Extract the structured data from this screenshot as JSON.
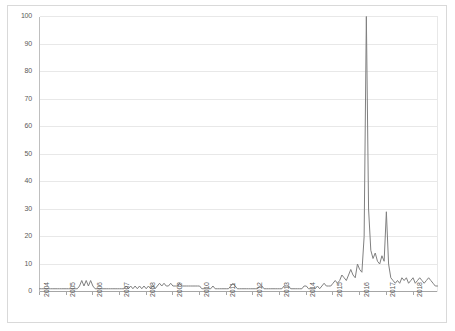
{
  "chart_data": {
    "type": "line",
    "title": "",
    "subtitle": "",
    "xlabel": "",
    "ylabel": "",
    "ylim": [
      0,
      100
    ],
    "ytick_values": [
      0,
      10,
      20,
      30,
      40,
      50,
      60,
      70,
      80,
      90,
      100
    ],
    "ytick_labels": [
      "0",
      "10",
      "20",
      "30",
      "40",
      "50",
      "60",
      "70",
      "80",
      "90",
      "100"
    ],
    "grid": "horizontal",
    "legend": "none",
    "legend_position": "none",
    "line_color": "#808080",
    "gridline_color": "#e8e8e8",
    "border_color": "#d9d9d9",
    "tick_label_color": "#595959",
    "xtick_labels": [
      "2004",
      "2005",
      "2006",
      "2007",
      "2008",
      "2009",
      "2010",
      "2011",
      "2012",
      "2013",
      "2014",
      "2015",
      "2016",
      "2017",
      "2018"
    ],
    "x_axis_note": "monthly series, Jan 2004 through Dec 2018; year tick marks at each January",
    "annotations": [
      "Primary peak reaches 100 in early 2016",
      "Secondary peak reaches about 29 in early 2017",
      "Baseline values near 1-4 from 2004 through 2014"
    ],
    "x": [
      "2004-01",
      "2004-02",
      "2004-03",
      "2004-04",
      "2004-05",
      "2004-06",
      "2004-07",
      "2004-08",
      "2004-09",
      "2004-10",
      "2004-11",
      "2004-12",
      "2005-01",
      "2005-02",
      "2005-03",
      "2005-04",
      "2005-05",
      "2005-06",
      "2005-07",
      "2005-08",
      "2005-09",
      "2005-10",
      "2005-11",
      "2005-12",
      "2006-01",
      "2006-02",
      "2006-03",
      "2006-04",
      "2006-05",
      "2006-06",
      "2006-07",
      "2006-08",
      "2006-09",
      "2006-10",
      "2006-11",
      "2006-12",
      "2007-01",
      "2007-02",
      "2007-03",
      "2007-04",
      "2007-05",
      "2007-06",
      "2007-07",
      "2007-08",
      "2007-09",
      "2007-10",
      "2007-11",
      "2007-12",
      "2008-01",
      "2008-02",
      "2008-03",
      "2008-04",
      "2008-05",
      "2008-06",
      "2008-07",
      "2008-08",
      "2008-09",
      "2008-10",
      "2008-11",
      "2008-12",
      "2009-01",
      "2009-02",
      "2009-03",
      "2009-04",
      "2009-05",
      "2009-06",
      "2009-07",
      "2009-08",
      "2009-09",
      "2009-10",
      "2009-11",
      "2009-12",
      "2010-01",
      "2010-02",
      "2010-03",
      "2010-04",
      "2010-05",
      "2010-06",
      "2010-07",
      "2010-08",
      "2010-09",
      "2010-10",
      "2010-11",
      "2010-12",
      "2011-01",
      "2011-02",
      "2011-03",
      "2011-04",
      "2011-05",
      "2011-06",
      "2011-07",
      "2011-08",
      "2011-09",
      "2011-10",
      "2011-11",
      "2011-12",
      "2012-01",
      "2012-02",
      "2012-03",
      "2012-04",
      "2012-05",
      "2012-06",
      "2012-07",
      "2012-08",
      "2012-09",
      "2012-10",
      "2012-11",
      "2012-12",
      "2013-01",
      "2013-02",
      "2013-03",
      "2013-04",
      "2013-05",
      "2013-06",
      "2013-07",
      "2013-08",
      "2013-09",
      "2013-10",
      "2013-11",
      "2013-12",
      "2014-01",
      "2014-02",
      "2014-03",
      "2014-04",
      "2014-05",
      "2014-06",
      "2014-07",
      "2014-08",
      "2014-09",
      "2014-10",
      "2014-11",
      "2014-12",
      "2015-01",
      "2015-02",
      "2015-03",
      "2015-04",
      "2015-05",
      "2015-06",
      "2015-07",
      "2015-08",
      "2015-09",
      "2015-10",
      "2015-11",
      "2015-12",
      "2016-01",
      "2016-02",
      "2016-03",
      "2016-04",
      "2016-05",
      "2016-06",
      "2016-07",
      "2016-08",
      "2016-09",
      "2016-10",
      "2016-11",
      "2016-12",
      "2017-01",
      "2017-02",
      "2017-03",
      "2017-04",
      "2017-05",
      "2017-06",
      "2017-07",
      "2017-08",
      "2017-09",
      "2017-10",
      "2017-11",
      "2017-12",
      "2018-01",
      "2018-02",
      "2018-03",
      "2018-04",
      "2018-05",
      "2018-06",
      "2018-07",
      "2018-08",
      "2018-09",
      "2018-10",
      "2018-11",
      "2018-12"
    ],
    "values": [
      1,
      1,
      1,
      1,
      1,
      1,
      1,
      1,
      1,
      1,
      1,
      1,
      1,
      1,
      1,
      1,
      1,
      1,
      2,
      4,
      2,
      4,
      2,
      4,
      2,
      1,
      1,
      1,
      1,
      1,
      1,
      1,
      1,
      1,
      1,
      1,
      1,
      1,
      1,
      2,
      1,
      2,
      1,
      2,
      1,
      2,
      1,
      2,
      1,
      2,
      1,
      2,
      1,
      2,
      3,
      2,
      3,
      2,
      2,
      3,
      2,
      2,
      2,
      3,
      2,
      2,
      2,
      2,
      2,
      2,
      2,
      2,
      2,
      1,
      1,
      1,
      1,
      1,
      2,
      1,
      1,
      1,
      1,
      1,
      1,
      1,
      2,
      3,
      2,
      1,
      1,
      1,
      1,
      1,
      1,
      1,
      1,
      1,
      1,
      2,
      2,
      1,
      1,
      1,
      1,
      1,
      1,
      1,
      1,
      1,
      2,
      2,
      2,
      1,
      1,
      1,
      1,
      1,
      1,
      2,
      2,
      1,
      1,
      1,
      1,
      2,
      1,
      2,
      3,
      2,
      2,
      2,
      3,
      4,
      3,
      4,
      6,
      5,
      4,
      6,
      8,
      6,
      5,
      10,
      8,
      7,
      20,
      100,
      30,
      15,
      12,
      14,
      11,
      10,
      13,
      11,
      29,
      10,
      5,
      4,
      3,
      4,
      3,
      5,
      4,
      5,
      3,
      4,
      5,
      3,
      4,
      5,
      4,
      3,
      4,
      5,
      4,
      3,
      2,
      2
    ]
  }
}
